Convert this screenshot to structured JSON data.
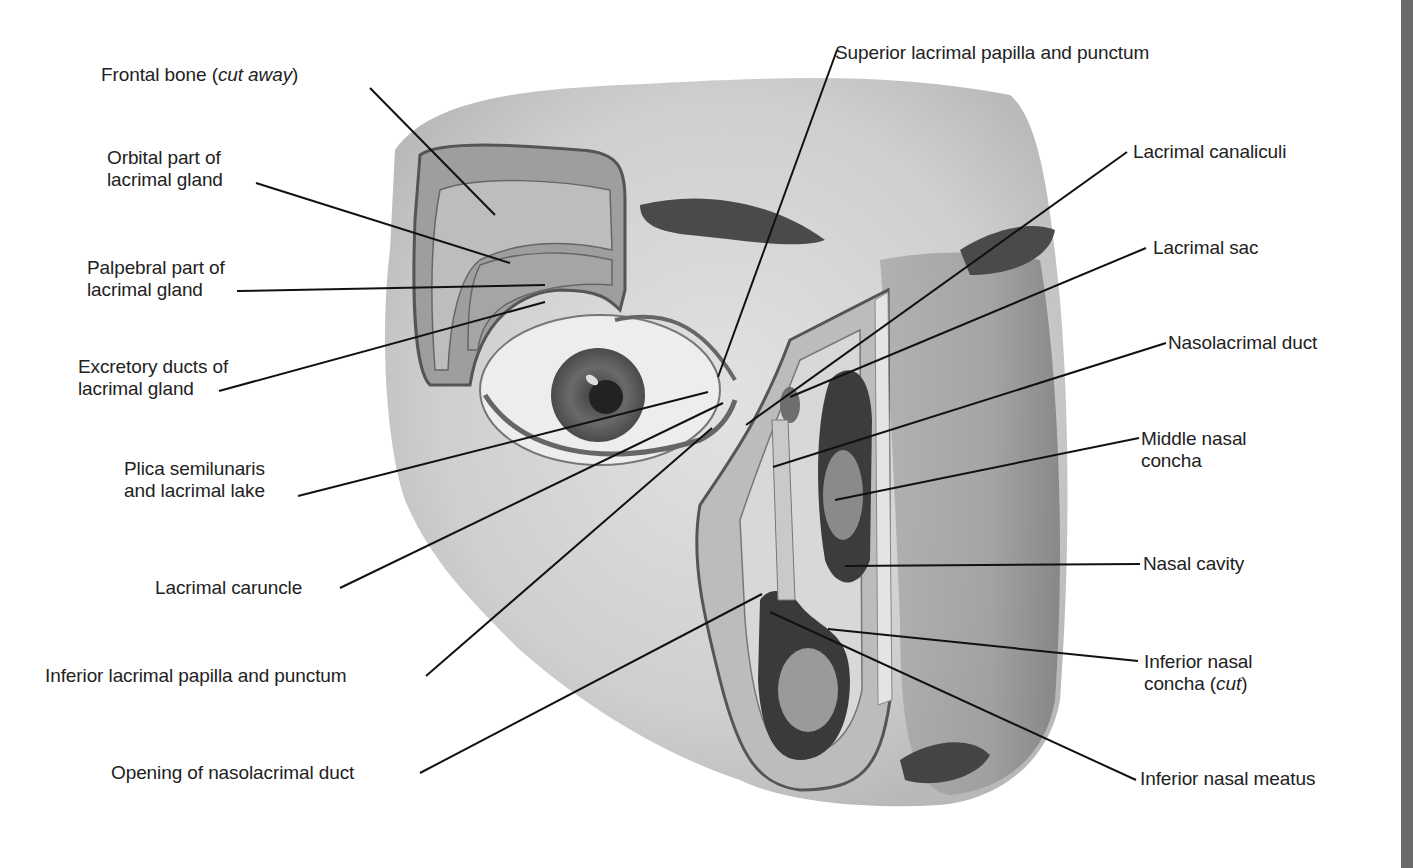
{
  "figure": {
    "colors": {
      "background": "#ffffff",
      "label_text": "#222222",
      "leader_line": "#111111",
      "skin_wash": "#c8c8c8",
      "bone": "#b5b5b5",
      "cavity_dark": "#444444",
      "right_strip": "#6a6a6a"
    },
    "labels_left": [
      {
        "id": "frontal-bone",
        "text": "Frontal bone (",
        "italic": "cut away",
        "suffix": ")"
      },
      {
        "id": "orbital-part",
        "line1": "Orbital part of",
        "line2": "lacrimal gland"
      },
      {
        "id": "palpebral-part",
        "line1": "Palpebral part of",
        "line2": "lacrimal gland"
      },
      {
        "id": "excretory-ducts",
        "line1": "Excretory ducts of",
        "line2": "lacrimal gland"
      },
      {
        "id": "plica-semilunaris",
        "line1": "Plica semilunaris",
        "line2": "and lacrimal lake"
      },
      {
        "id": "lacrimal-caruncle",
        "text": "Lacrimal caruncle"
      },
      {
        "id": "inferior-papilla",
        "text": "Inferior lacrimal papilla and punctum"
      },
      {
        "id": "opening-duct",
        "text": "Opening of nasolacrimal duct"
      }
    ],
    "labels_right": [
      {
        "id": "superior-papilla",
        "text": "Superior lacrimal papilla and punctum"
      },
      {
        "id": "lacrimal-canaliculi",
        "text": "Lacrimal canaliculi"
      },
      {
        "id": "lacrimal-sac",
        "text": "Lacrimal sac"
      },
      {
        "id": "nasolacrimal-duct",
        "text": "Nasolacrimal duct"
      },
      {
        "id": "middle-concha",
        "line1": "Middle nasal",
        "line2": "concha"
      },
      {
        "id": "nasal-cavity",
        "text": "Nasal cavity"
      },
      {
        "id": "inferior-concha",
        "line1": "Inferior nasal",
        "line2": "concha (",
        "italic": "cut",
        "suffix": ")"
      },
      {
        "id": "inferior-meatus",
        "text": "Inferior nasal meatus"
      }
    ]
  }
}
